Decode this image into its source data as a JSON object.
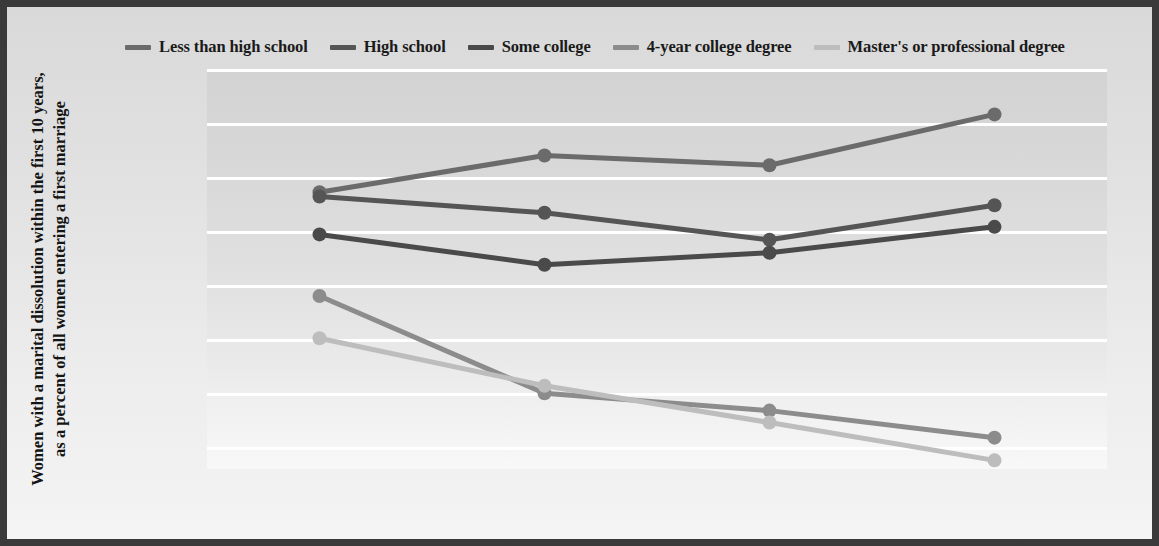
{
  "chart_data": {
    "type": "line",
    "title": "",
    "xlabel": "",
    "ylabel": "Women with a marital dissolution within the first 10 years, as a percent of all women entering a first marriage",
    "categories": [
      "1975–1979",
      "1980–1984",
      "1985–1989",
      "1990–1994"
    ],
    "ylim": [
      13,
      50
    ],
    "yticks": [
      "50%",
      "45%",
      "40%",
      "35%",
      "30%",
      "25%",
      "20%",
      "15%"
    ],
    "ytick_values": [
      50,
      45,
      40,
      35,
      30,
      25,
      20,
      15
    ],
    "grid": true,
    "legend_position": "top",
    "series": [
      {
        "name": "Less than high school",
        "color": "#6b6b6b",
        "values": [
          38.6,
          42.0,
          41.1,
          45.8
        ]
      },
      {
        "name": "High school",
        "color": "#555555",
        "values": [
          38.2,
          36.7,
          34.2,
          37.4
        ]
      },
      {
        "name": "Some college",
        "color": "#4a4a4a",
        "values": [
          34.7,
          31.9,
          33.0,
          35.4
        ]
      },
      {
        "name": "4-year college degree",
        "color": "#8c8c8c",
        "values": [
          29.0,
          20.0,
          18.4,
          15.9
        ]
      },
      {
        "name": "Master's or professional degree",
        "color": "#bdbdbd",
        "values": [
          25.1,
          20.7,
          17.3,
          13.8
        ]
      }
    ]
  },
  "style": {
    "frame_border_color": "#3a3a3a",
    "gridline_color": "#ffffff",
    "text_color": "#131313",
    "plot_bg_top": "#d3d3d3",
    "plot_bg_bottom": "#f8f8f8"
  }
}
